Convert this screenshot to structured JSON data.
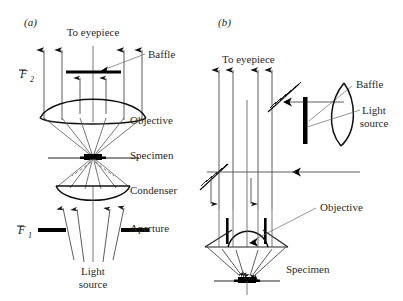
{
  "figure": {
    "type": "optical-ray-diagram",
    "width": 403,
    "height": 301,
    "background_color": "#ffffff",
    "ink_color": "#111111",
    "ray_color": "#4a4a4a",
    "leader_color": "#6a6a6a"
  },
  "panels": [
    {
      "id": "a",
      "label": "(a)",
      "title": "Transmitted-light (Koehler) illumination",
      "label_x": 24,
      "label_y": 26,
      "top_label": {
        "text": "To eyepiece",
        "x": 93,
        "y": 36
      },
      "bottom_label": {
        "line1": "Light",
        "line2": "source",
        "x": 93,
        "y": 275
      },
      "focal_planes": [
        {
          "symbol": "F",
          "subscript": "2",
          "name": "back-focal-plane",
          "x": 24,
          "y": 76
        },
        {
          "symbol": "F",
          "subscript": "1",
          "name": "front-focal-plane",
          "x": 22,
          "y": 232
        }
      ],
      "components": [
        {
          "name": "baffle",
          "label": "Baffle",
          "label_x": 148,
          "label_y": 58,
          "y": 72,
          "kind": "central-stop"
        },
        {
          "name": "objective",
          "label": "Objective",
          "label_x": 130,
          "label_y": 124,
          "y": 118,
          "kind": "biconvex-lens"
        },
        {
          "name": "specimen",
          "label": "Specimen",
          "label_x": 130,
          "label_y": 159,
          "y": 158,
          "kind": "sample-plane"
        },
        {
          "name": "condenser",
          "label": "Condenser",
          "label_x": 130,
          "label_y": 194,
          "y": 189,
          "kind": "plano-convex-lens"
        },
        {
          "name": "aperture",
          "label": "Aperture",
          "label_x": 130,
          "label_y": 232,
          "y": 230,
          "kind": "annular-aperture"
        }
      ]
    },
    {
      "id": "b",
      "label": "(b)",
      "title": "Epi-illumination with half-mirror",
      "label_x": 218,
      "label_y": 26,
      "top_label": {
        "text": "To eyepiece",
        "x": 222,
        "y": 63
      },
      "components": [
        {
          "name": "baffle",
          "label": "Baffle",
          "label_x": 356,
          "label_y": 88,
          "kind": "vertical-stop"
        },
        {
          "name": "light-source",
          "label_line1": "Light",
          "label_line2": "source",
          "label_x": 374,
          "label_y": 114,
          "kind": "lamp"
        },
        {
          "name": "objective",
          "label": "Objective",
          "label_x": 320,
          "label_y": 211,
          "kind": "plano-convex-lens"
        },
        {
          "name": "specimen",
          "label": "Specimen",
          "label_x": 286,
          "label_y": 273,
          "kind": "sample-plane"
        },
        {
          "name": "half-mirror-upper",
          "label": "",
          "kind": "beam-splitter"
        },
        {
          "name": "half-mirror-lower",
          "label": "",
          "kind": "beam-splitter"
        },
        {
          "name": "collector-lens",
          "label": "",
          "kind": "lens"
        }
      ]
    }
  ],
  "labels": {
    "panel_a_letter": "(a)",
    "panel_b_letter": "(b)",
    "to_eyepiece": "To eyepiece",
    "baffle": "Baffle",
    "objective": "Objective",
    "specimen": "Specimen",
    "condenser": "Condenser",
    "aperture": "Aperture",
    "light": "Light",
    "source": "source",
    "focal_f": "F",
    "focal_sub_2": "2",
    "focal_sub_1": "1"
  }
}
